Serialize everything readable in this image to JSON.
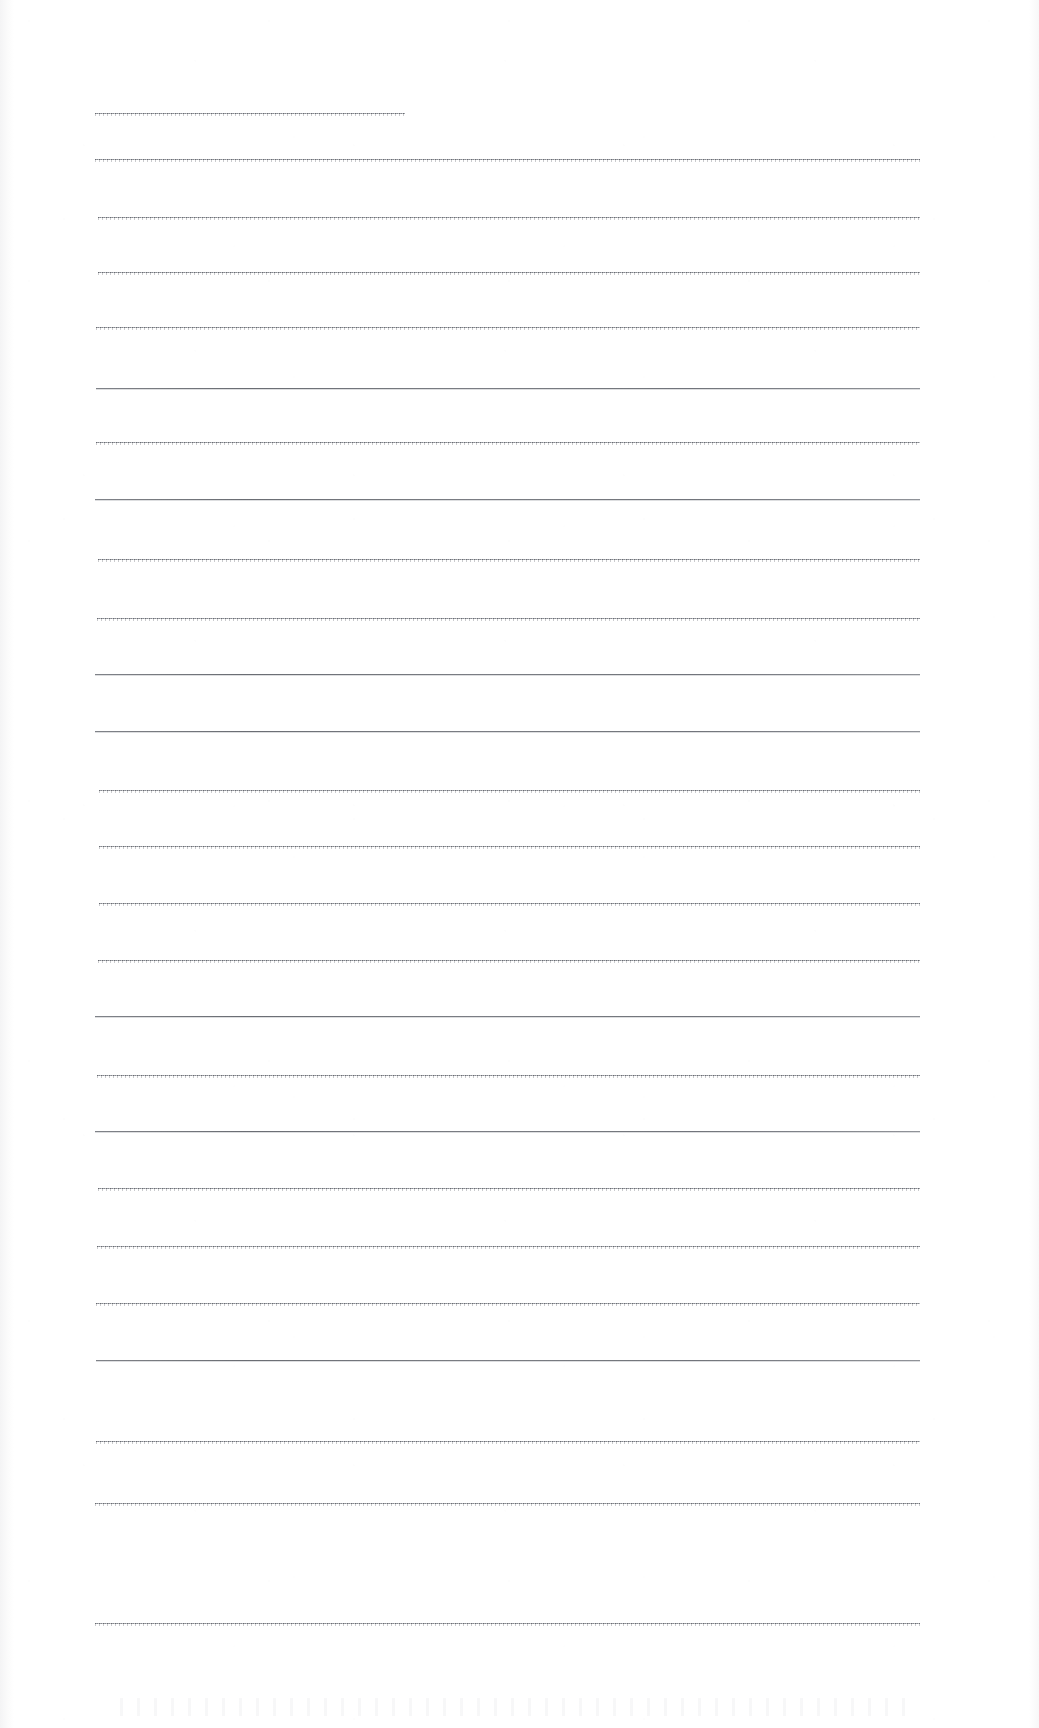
{
  "page": {
    "kind": "scanned-blank-ruled-sheet",
    "width": 1039,
    "height": 1728,
    "background_color": "#ffffff",
    "rule_color": "#6f7278",
    "text_content": "",
    "visible_text_lines": []
  },
  "ruling": {
    "line_count": 25,
    "default_left_x": 95,
    "default_right_x": 920,
    "lines": [
      {
        "y": 113,
        "x1": 95,
        "x2": 405,
        "style": "textured"
      },
      {
        "y": 159,
        "x1": 95,
        "x2": 920,
        "style": "textured"
      },
      {
        "y": 217,
        "x1": 98,
        "x2": 920,
        "style": "textured"
      },
      {
        "y": 272,
        "x1": 98,
        "x2": 920,
        "style": "textured"
      },
      {
        "y": 327,
        "x1": 96,
        "x2": 920,
        "style": "textured"
      },
      {
        "y": 388,
        "x1": 96,
        "x2": 920,
        "style": "solid"
      },
      {
        "y": 442,
        "x1": 96,
        "x2": 920,
        "style": "textured"
      },
      {
        "y": 499,
        "x1": 95,
        "x2": 920,
        "style": "solid"
      },
      {
        "y": 559,
        "x1": 98,
        "x2": 920,
        "style": "textured"
      },
      {
        "y": 618,
        "x1": 97,
        "x2": 920,
        "style": "textured"
      },
      {
        "y": 674,
        "x1": 95,
        "x2": 920,
        "style": "solid"
      },
      {
        "y": 731,
        "x1": 95,
        "x2": 920,
        "style": "solid"
      },
      {
        "y": 790,
        "x1": 99,
        "x2": 920,
        "style": "textured"
      },
      {
        "y": 846,
        "x1": 99,
        "x2": 920,
        "style": "textured"
      },
      {
        "y": 903,
        "x1": 99,
        "x2": 920,
        "style": "textured"
      },
      {
        "y": 960,
        "x1": 98,
        "x2": 920,
        "style": "textured"
      },
      {
        "y": 1016,
        "x1": 95,
        "x2": 920,
        "style": "solid"
      },
      {
        "y": 1075,
        "x1": 97,
        "x2": 920,
        "style": "textured"
      },
      {
        "y": 1131,
        "x1": 95,
        "x2": 920,
        "style": "solid"
      },
      {
        "y": 1188,
        "x1": 98,
        "x2": 920,
        "style": "textured"
      },
      {
        "y": 1246,
        "x1": 97,
        "x2": 920,
        "style": "textured"
      },
      {
        "y": 1303,
        "x1": 96,
        "x2": 920,
        "style": "textured"
      },
      {
        "y": 1360,
        "x1": 96,
        "x2": 920,
        "style": "solid"
      },
      {
        "y": 1441,
        "x1": 96,
        "x2": 920,
        "style": "textured"
      },
      {
        "y": 1503,
        "x1": 95,
        "x2": 920,
        "style": "textured"
      },
      {
        "y": 1623,
        "x1": 95,
        "x2": 920,
        "style": "textured"
      }
    ]
  }
}
